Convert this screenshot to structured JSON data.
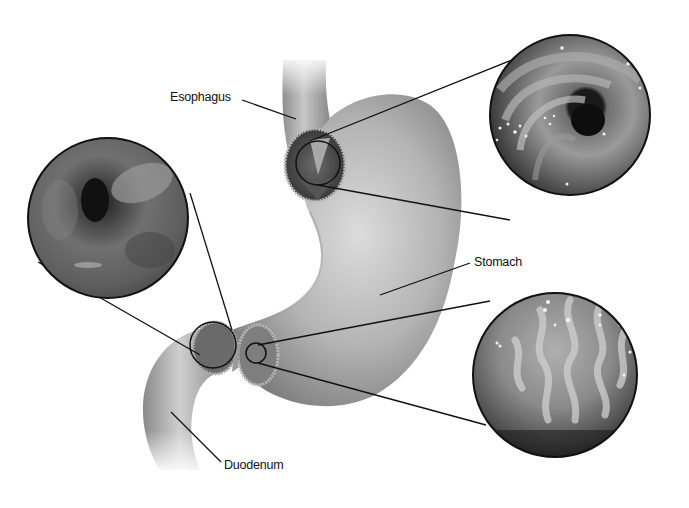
{
  "figure": {
    "labels": {
      "esophagus": "Esophagus",
      "stomach": "Stomach",
      "duodenum": "Duodenum"
    },
    "insets": [
      {
        "name": "esophagus-gastric-junction-view",
        "position": "top-right"
      },
      {
        "name": "pylorus-duodenal-view",
        "position": "left"
      },
      {
        "name": "gastric-rugae-view",
        "position": "bottom-right"
      }
    ],
    "colors": {
      "background": "#ffffff",
      "organ_light": "#d4d4d4",
      "organ_mid": "#9a9a9a",
      "organ_dark": "#5a5a5a",
      "line": "#111111"
    }
  }
}
